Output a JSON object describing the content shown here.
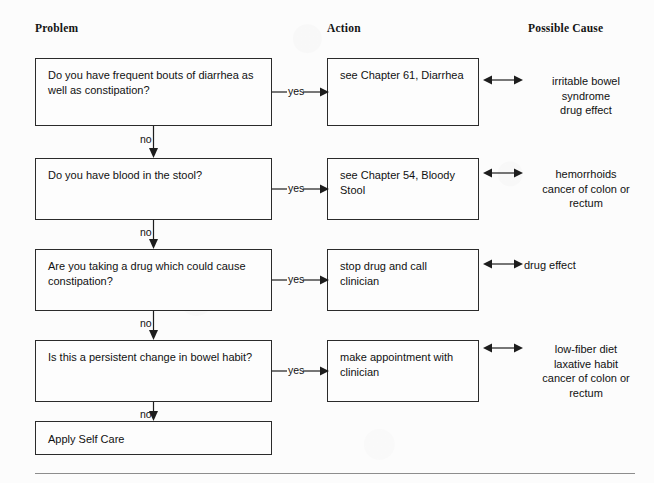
{
  "headers": [
    {
      "label": "Problem"
    },
    {
      "label": "Action"
    },
    {
      "label": "Possible Cause"
    }
  ],
  "edge_labels": {
    "yes": "yes",
    "no": "no"
  },
  "rows": [
    {
      "problem": "Do you have frequent bouts of diarrhea as\nwell as constipation?",
      "action": "see Chapter 61, Diarrhea",
      "cause": "irritable bowel\nsyndrome\ndrug effect"
    },
    {
      "problem": "Do you have blood in the stool?",
      "action": "see Chapter 54, Bloody\nStool",
      "cause": "hemorrhoids\ncancer of colon or\nrectum"
    },
    {
      "problem": "Are you taking a drug which could cause\nconstipation?",
      "action": "stop drug and call\nclinician",
      "cause": "drug effect"
    },
    {
      "problem": "Is this a persistent change in bowel habit?",
      "action": "make appointment with\nclinician",
      "cause": "low-fiber diet\nlaxative habit\ncancer of colon or\nrectum"
    }
  ],
  "terminal": {
    "label": "Apply Self Care"
  },
  "colors": {
    "ink": "#1d1d1d",
    "paper": "#fbfbfb",
    "rule": "#8d8d8d"
  }
}
